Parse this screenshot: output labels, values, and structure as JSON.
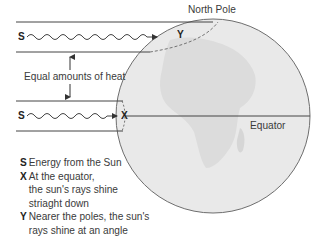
{
  "diagram": {
    "title_label": "North Pole",
    "equator_label": "Equator",
    "heat_label": "Equal amounts of heat",
    "ray_top": {
      "source_letter": "S",
      "target_letter": "Y"
    },
    "ray_bottom": {
      "source_letter": "S",
      "target_letter": "X"
    },
    "colors": {
      "globe_fill": "#e9e9e9",
      "globe_outline": "#6e6e6e",
      "line": "#444444",
      "text": "#3a3a3a"
    }
  },
  "legend": {
    "items": [
      {
        "key": "S",
        "lines": [
          "Energy from the Sun"
        ]
      },
      {
        "key": "X",
        "lines": [
          "At the equator,",
          "the sun's rays shine",
          "striaght down"
        ]
      },
      {
        "key": "Y",
        "lines": [
          "Nearer the poles, the sun's",
          "rays shine at an angle"
        ]
      }
    ]
  }
}
